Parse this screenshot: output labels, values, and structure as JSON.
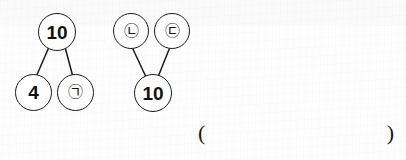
{
  "figure": {
    "type": "number-bond-diagram-pair",
    "background_color": "#fdfdfd",
    "stroke_color": "#1b1b1b",
    "text_color": "#111111"
  },
  "left_diagram": {
    "name": "left-number-bond",
    "whole": {
      "label": "10",
      "kind": "number"
    },
    "parts": [
      {
        "label": "4",
        "kind": "number"
      },
      {
        "label": "㉠",
        "kind": "circled-hangul",
        "reading": "giyeok"
      }
    ]
  },
  "right_diagram": {
    "name": "right-number-bond",
    "whole": {
      "label": "10",
      "kind": "number"
    },
    "parts": [
      {
        "label": "㉡",
        "kind": "circled-hangul",
        "reading": "nieun"
      },
      {
        "label": "㉢",
        "kind": "circled-hangul",
        "reading": "digeut"
      }
    ]
  },
  "answer_blank": {
    "open_paren": "(",
    "close_paren": ")",
    "value": ""
  }
}
